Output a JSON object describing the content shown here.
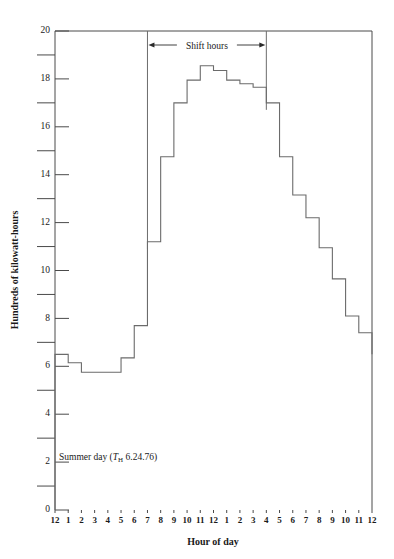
{
  "chart_data": {
    "type": "area",
    "style": "step-post",
    "title": "",
    "xlabel": "Hour of day",
    "ylabel": "Hundreds of kilowatt-hours",
    "ylim": [
      0,
      20
    ],
    "ytick_step": 2,
    "yminor_step": 1,
    "grid": false,
    "legend": "none",
    "ytick_labels": [
      "0",
      "2",
      "4",
      "6",
      "8",
      "10",
      "12",
      "14",
      "16",
      "18",
      "20"
    ],
    "ytick_values": [
      0,
      2,
      4,
      6,
      8,
      10,
      12,
      14,
      16,
      18,
      20
    ],
    "yminor_values": [
      1,
      3,
      5,
      7,
      9,
      11,
      13,
      15,
      17,
      19
    ],
    "xtick_labels": [
      "12",
      "1",
      "2",
      "3",
      "4",
      "5",
      "6",
      "7",
      "8",
      "9",
      "10",
      "11",
      "12",
      "1",
      "2",
      "3",
      "4",
      "5",
      "6",
      "7",
      "8",
      "9",
      "10",
      "11",
      "12"
    ],
    "x_index": [
      0,
      1,
      2,
      3,
      4,
      5,
      6,
      7,
      8,
      9,
      10,
      11,
      12,
      13,
      14,
      15,
      16,
      17,
      18,
      19,
      20,
      21,
      22,
      23
    ],
    "hour_spans": [
      "12-1 am",
      "1-2 am",
      "2-3 am",
      "3-4 am",
      "4-5 am",
      "5-6 am",
      "6-7 am",
      "7-8 am",
      "8-9 am",
      "9-10 am",
      "10-11 am",
      "11-12 noon",
      "12-1 pm",
      "1-2 pm",
      "2-3 pm",
      "3-4 pm",
      "4-5 pm",
      "5-6 pm",
      "6-7 pm",
      "7-8 pm",
      "8-9 pm",
      "9-10 pm",
      "10-11 pm",
      "11-12 pm"
    ],
    "values": [
      6.5,
      6.15,
      5.75,
      5.75,
      5.75,
      6.35,
      7.7,
      11.2,
      14.75,
      17.0,
      17.95,
      18.55,
      18.35,
      17.95,
      17.8,
      17.65,
      17.0,
      14.75,
      13.15,
      12.2,
      10.95,
      9.65,
      8.1,
      7.4
    ],
    "final_value": 6.5,
    "units": "hundreds of kilowatt-hours",
    "annotations": [
      {
        "name": "summer-day-note",
        "text_prefix": "Summer day (",
        "symbol": "T",
        "subscript": "H",
        "text_suffix": " 6.24.76)",
        "full_text": "Summer day (T_H 6.24.76)",
        "x_value": 0.3,
        "y_value": 2.1
      }
    ],
    "shift_hours": {
      "label": "Shift hours",
      "start_index": 7,
      "end_index": 16,
      "start_hour": "7 am",
      "end_hour": "4 pm"
    },
    "series_color": "#6b6b6b",
    "axis_color": "#4a4a4a",
    "text_color": "#1a1a1a"
  }
}
